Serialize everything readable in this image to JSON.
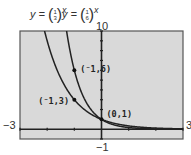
{
  "chart_data": {
    "type": "line",
    "title": "",
    "equations": [
      {
        "label": "y = (1/3)^x",
        "base_num": "1",
        "base_den": "3"
      },
      {
        "label": "y = (1/6)^x",
        "base_num": "1",
        "base_den": "6"
      }
    ],
    "series": [
      {
        "name": "y=(1/3)^x",
        "function": "(1/3)^x",
        "x": [
          -2.1,
          -2,
          -1.5,
          -1,
          -0.5,
          0,
          0.5,
          1,
          2,
          3
        ],
        "y": [
          10,
          9,
          5.2,
          3,
          1.73,
          1,
          0.58,
          0.33,
          0.11,
          0.04
        ]
      },
      {
        "name": "y=(1/6)^x",
        "function": "(1/6)^x",
        "x": [
          -1.29,
          -1,
          -0.5,
          0,
          0.5,
          1,
          2,
          3
        ],
        "y": [
          10,
          6,
          2.45,
          1,
          0.41,
          0.17,
          0.03,
          0.005
        ]
      }
    ],
    "annotations": [
      {
        "text": "(⁻1,6)",
        "x": -1,
        "y": 6
      },
      {
        "text": "(⁻1,3)",
        "x": -1,
        "y": 3
      },
      {
        "text": "(0,1)",
        "x": 0,
        "y": 1
      }
    ],
    "xlim": [
      -3,
      3
    ],
    "ylim": [
      -1,
      10
    ],
    "window_labels": {
      "xmin": "−3",
      "xmax": "3",
      "ymin": "−1",
      "ymax": "10"
    },
    "xlabel": "",
    "ylabel": "",
    "grid": false,
    "background": "#d9d9d9",
    "curve_color": "#222222"
  },
  "labels": {
    "eq1_prefix": "y = ",
    "eq1_num": "1",
    "eq1_den": "3",
    "eq1_exp": "x",
    "eq2_prefix": "y = ",
    "eq2_num": "1",
    "eq2_den": "6",
    "eq2_exp": "x",
    "ymax": "10",
    "ymin": "−1",
    "xmin": "−3",
    "xmax": "3",
    "pt1": "(⁻1,6)",
    "pt2": "(⁻1,3)",
    "pt3": "(0,1)"
  }
}
